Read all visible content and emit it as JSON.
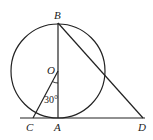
{
  "diagram": {
    "type": "geometry",
    "points": {
      "B": {
        "label": "B",
        "x": 58,
        "y": 23
      },
      "O": {
        "label": "O",
        "x": 58,
        "y": 71
      },
      "A": {
        "label": "A",
        "x": 58,
        "y": 118
      },
      "C": {
        "label": "C",
        "x": 33,
        "y": 118
      },
      "D": {
        "label": "D",
        "x": 143,
        "y": 118
      }
    },
    "circle": {
      "center": "O",
      "radius": 47
    },
    "angle_label": "30°",
    "colors": {
      "stroke": "#222222",
      "background": "#ffffff"
    }
  }
}
